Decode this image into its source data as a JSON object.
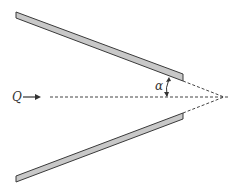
{
  "diagram": {
    "flow_label": "Q",
    "angle_label": "α",
    "colors": {
      "plate_fill": "#c8c8c8",
      "plate_stroke": "#3a3a3a",
      "line": "#444444"
    },
    "elements": [
      "top plate (inclined)",
      "bottom plate (inclined)",
      "dashed centerline",
      "dashed plate extensions meeting at apex",
      "angle arc alpha between plate and centerline",
      "flow arrow Q"
    ]
  }
}
